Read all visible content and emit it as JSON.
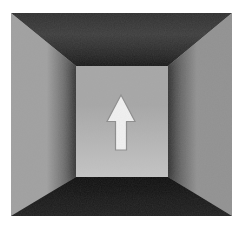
{
  "scene": {
    "description": "Grayscale photograph looking into the interior of a rectangular box corridor; a pale upward-pointing arrow sign is centered on the far wall",
    "arrow": {
      "icon": "arrow-up-icon",
      "direction": "up",
      "fill": "#f1f1f1",
      "outline": "#8d8d8d"
    },
    "colors": {
      "frame_bg": "#ffffff",
      "left_wall": "#a0a0a0",
      "left_wall_deep": "#4e4e4e",
      "right_wall": "#919191",
      "right_wall_deep": "#474747",
      "ceiling_front": "#2f2f2f",
      "ceiling_mid": "#3d3d3d",
      "ceiling_back": "#1e1e1e",
      "floor_front": "#202020",
      "floor_back": "#0f0f0f",
      "back_wall_top": "#a6a6a6",
      "back_wall_bottom": "#c4c4c4"
    }
  }
}
